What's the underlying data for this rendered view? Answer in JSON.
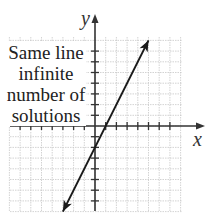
{
  "annotation": {
    "lines": [
      "Same line",
      "infinite",
      "number of",
      "solutions"
    ]
  },
  "axes": {
    "x_label": "x",
    "y_label": "y"
  },
  "chart_data": {
    "type": "line",
    "title": "",
    "xlabel": "x",
    "ylabel": "y",
    "xlim": [
      -8,
      8
    ],
    "ylim": [
      -8,
      8
    ],
    "grid": true,
    "series": [
      {
        "name": "line",
        "equation": "y = 2x - 2",
        "x": [
          -3,
          5
        ],
        "y": [
          -8,
          8
        ],
        "arrows": "both"
      }
    ],
    "annotations": [
      "Same line infinite number of solutions"
    ]
  },
  "colors": {
    "grid": "#c8c8c8",
    "axis": "#333333",
    "line": "#1a1a1a"
  }
}
